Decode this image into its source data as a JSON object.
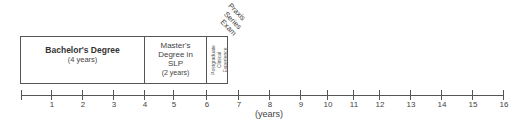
{
  "diagram": {
    "type": "timeline",
    "axis": {
      "label": "(years)",
      "min": 0,
      "max": 16,
      "ticks": [
        {
          "value": 0,
          "label": "",
          "x": 21
        },
        {
          "value": 1,
          "label": "1",
          "x": 51
        },
        {
          "value": 2,
          "label": "2",
          "x": 82
        },
        {
          "value": 3,
          "label": "3",
          "x": 113
        },
        {
          "value": 4,
          "label": "4",
          "x": 144
        },
        {
          "value": 5,
          "label": "5",
          "x": 173
        },
        {
          "value": 6,
          "label": "6",
          "x": 206
        },
        {
          "value": 7,
          "label": "7",
          "x": 238
        },
        {
          "value": 8,
          "label": "8",
          "x": 269
        },
        {
          "value": 9,
          "label": "9",
          "x": 300
        },
        {
          "value": 10,
          "label": "10",
          "x": 327
        },
        {
          "value": 11,
          "label": "11",
          "x": 353
        },
        {
          "value": 12,
          "label": "12",
          "x": 379
        },
        {
          "value": 13,
          "label": "13",
          "x": 410
        },
        {
          "value": 14,
          "label": "14",
          "x": 441
        },
        {
          "value": 15,
          "label": "15",
          "x": 472
        },
        {
          "value": 16,
          "label": "16",
          "x": 503
        }
      ]
    },
    "segments": [
      {
        "id": "bachelors",
        "title": "Bachelor's Degree",
        "duration": "(4 years)",
        "start": 0,
        "end": 4
      },
      {
        "id": "masters",
        "title_lines": [
          "Master's",
          "Degree in",
          "SLP"
        ],
        "duration": "(2 years)",
        "start": 4,
        "end": 6
      },
      {
        "id": "postgraduate",
        "lines": [
          "Postgraduate",
          "Clinical",
          "Experience"
        ],
        "start": 6,
        "end": 6.7
      }
    ],
    "milestone": {
      "lines": [
        "Praxis",
        "Series",
        "Exam"
      ],
      "at": 6.7
    }
  }
}
